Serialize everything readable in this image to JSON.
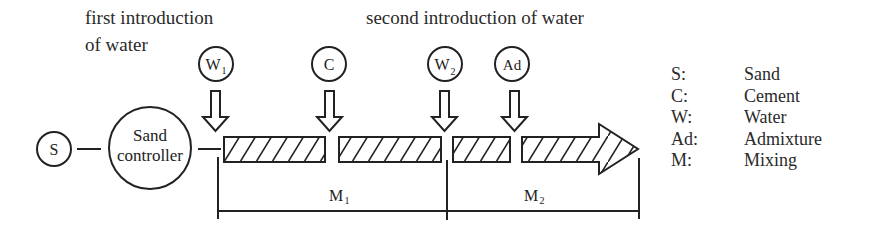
{
  "annotations": {
    "first_intro_line1": "first introduction",
    "first_intro_line2": "of water",
    "second_intro": "second introduction of water"
  },
  "nodes": {
    "sand": "S",
    "sand_controller_line1": "Sand",
    "sand_controller_line2": "controller",
    "water1_main": "W",
    "water1_sub": "1",
    "cement": "C",
    "water2_main": "W",
    "water2_sub": "2",
    "admixture": "Ad"
  },
  "stages": {
    "m1_main": "M",
    "m1_sub": "1",
    "m2_main": "M",
    "m2_sub": "2"
  },
  "legend": [
    {
      "key": "S:",
      "value": "Sand"
    },
    {
      "key": "C:",
      "value": "Cement"
    },
    {
      "key": "W:",
      "value": "Water"
    },
    {
      "key": "Ad:",
      "value": "Admixture"
    },
    {
      "key": "M:",
      "value": "Mixing"
    }
  ],
  "colors": {
    "stroke": "#222222",
    "background": "#ffffff"
  }
}
